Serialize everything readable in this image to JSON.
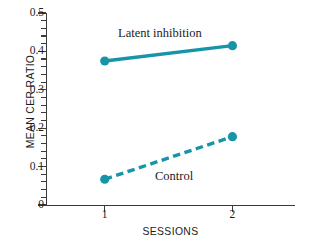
{
  "chart_data": {
    "type": "line",
    "title": "",
    "xlabel": "SESSIONS",
    "ylabel": "MEAN CER RATIO",
    "categories": [
      "1",
      "2"
    ],
    "x": [
      1,
      2
    ],
    "xlim": [
      0.54,
      2.49
    ],
    "ylim": [
      0,
      0.5
    ],
    "y_major_ticks": [
      0,
      0.1,
      0.2,
      0.3,
      0.4,
      0.5
    ],
    "y_tick_labels": [
      "0",
      "0.1",
      "0.2",
      "0.3",
      "0.4",
      "0.5"
    ],
    "y_minor_tick_step": 0.02,
    "x_tick_labels": [
      "1",
      "2"
    ],
    "grid": false,
    "legend": "inline-annotations",
    "series": [
      {
        "name": "Latent inhibition",
        "values": [
          0.375,
          0.415
        ],
        "linestyle": "solid",
        "color": "#1795a8",
        "marker": "circle",
        "label_x": 1.32,
        "label_y": 0.468
      },
      {
        "name": "Control",
        "values": [
          0.067,
          0.178
        ],
        "linestyle": "dashed",
        "color": "#1795a8",
        "marker": "circle",
        "label_x": 1.62,
        "label_y": 0.093
      }
    ],
    "annotations": [
      {
        "text": "Latent inhibition"
      },
      {
        "text": "Control"
      }
    ]
  },
  "colors": {
    "series": "#1795a8",
    "axis": "#3b3b3b",
    "text": "#1c1c1c",
    "background": "#ffffff"
  }
}
